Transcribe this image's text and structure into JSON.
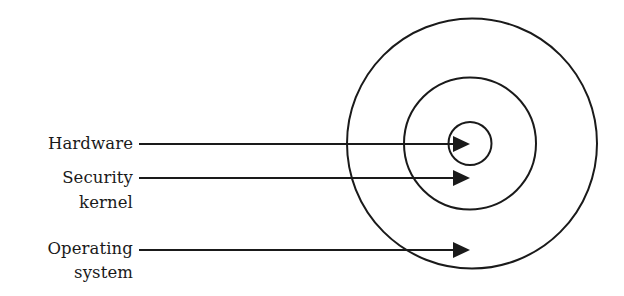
{
  "diagram": {
    "title": "",
    "type": "concentric-rings",
    "stroke_color": "#1a1a1a",
    "background": "#ffffff",
    "rings": [
      {
        "id": "hardware",
        "cx": 470,
        "cy": 143.5,
        "r": 21.5
      },
      {
        "id": "security-kernel",
        "cx": 470,
        "cy": 143.5,
        "r": 66
      },
      {
        "id": "operating-system",
        "cx": 472,
        "cy": 143.5,
        "r": 125
      }
    ],
    "labels": [
      {
        "id": "hardware",
        "lines": [
          "Hardware"
        ],
        "arrow_y": 144
      },
      {
        "id": "security-kernel",
        "lines": [
          "Security",
          "kernel"
        ],
        "arrow_y": 178
      },
      {
        "id": "operating-system",
        "lines": [
          "Operating",
          "system"
        ],
        "arrow_y": 250
      }
    ],
    "arrow_start_x": 139,
    "arrow_tip_x": 469
  }
}
